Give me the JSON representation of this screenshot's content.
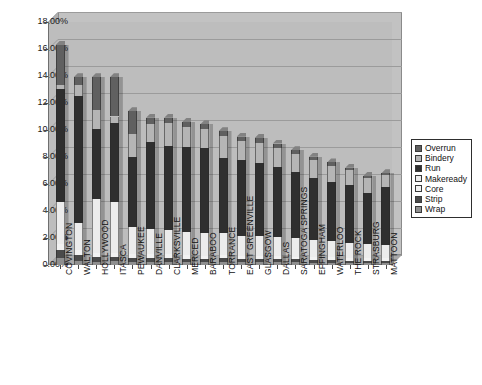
{
  "chart_data": {
    "type": "bar",
    "subtype": "stacked-column-3d",
    "title": "",
    "xlabel": "",
    "ylabel": "",
    "ylim": [
      0,
      0.18
    ],
    "ytick_labels": [
      "18.00%",
      "16.00%",
      "14.00%",
      "12.00%",
      "10.00%",
      "8.00%",
      "6.00%",
      "4.00%",
      "2.00%",
      "0.00%"
    ],
    "ytick_values": [
      18.0,
      16.0,
      14.0,
      12.0,
      10.0,
      8.0,
      6.0,
      4.0,
      2.0,
      0.0
    ],
    "grid": true,
    "legend_position": "right",
    "categories": [
      "COVINGTON",
      "WALTON",
      "HOLLYWOOD",
      "ITASCA",
      "PEWAUKEE",
      "DANVILLE",
      "CLARKSVILLE",
      "MERCED",
      "BARABOO",
      "TORRANCE",
      "EAST GREENVILLE",
      "GLASGOW",
      "DALLAS",
      "SARATOGA SPRINGS",
      "EFFINGHAM",
      "WATERLOO",
      "THE ROCK",
      "STRASBURG",
      "MATTOON"
    ],
    "series": [
      {
        "name": "Wrap",
        "color": "#8f8f8f",
        "values": [
          0.55,
          0.3,
          0.25,
          0.3,
          0.25,
          0.2,
          0.25,
          0.2,
          0.2,
          0.25,
          0.2,
          0.2,
          0.2,
          0.2,
          0.18,
          0.18,
          0.15,
          0.15,
          0.15
        ]
      },
      {
        "name": "Strip",
        "color": "#4a4a4a",
        "values": [
          0.55,
          0.45,
          0.35,
          0.3,
          0.3,
          0.3,
          0.3,
          0.25,
          0.25,
          0.25,
          0.25,
          0.25,
          0.25,
          0.22,
          0.2,
          0.2,
          0.18,
          0.18,
          0.18
        ]
      },
      {
        "name": "Core",
        "color": "#f2f2f2",
        "values": [
          0.45,
          0.35,
          0.3,
          0.3,
          0.28,
          0.28,
          0.26,
          0.26,
          0.24,
          0.24,
          0.22,
          0.22,
          0.22,
          0.2,
          0.2,
          0.18,
          0.18,
          0.16,
          0.16
        ]
      },
      {
        "name": "Makeready",
        "color": "#ececec",
        "values": [
          3.1,
          2.0,
          4.0,
          3.8,
          2.0,
          1.9,
          1.8,
          1.7,
          1.7,
          1.6,
          1.5,
          1.5,
          1.4,
          1.4,
          1.3,
          1.2,
          1.1,
          1.05,
          1.0
        ]
      },
      {
        "name": "Run",
        "color": "#2f2f2f",
        "values": [
          8.4,
          9.4,
          5.2,
          5.8,
          5.2,
          6.4,
          6.2,
          6.3,
          6.3,
          5.6,
          5.6,
          5.4,
          5.2,
          4.9,
          4.6,
          4.4,
          4.3,
          3.8,
          4.3
        ]
      },
      {
        "name": "Bindery",
        "color": "#b5b5b5",
        "values": [
          0.3,
          0.8,
          1.4,
          0.5,
          1.7,
          1.4,
          1.7,
          1.5,
          1.4,
          1.6,
          1.4,
          1.5,
          1.4,
          1.3,
          1.3,
          1.2,
          1.1,
          1.1,
          0.9
        ]
      },
      {
        "name": "Overrun",
        "color": "#606060",
        "values": [
          2.95,
          0.6,
          2.4,
          2.9,
          1.65,
          0.42,
          0.39,
          0.39,
          0.33,
          0.36,
          0.33,
          0.33,
          0.33,
          0.28,
          0.24,
          0.24,
          0.19,
          0.16,
          0.11
        ]
      }
    ],
    "totals": [
      16.3,
      13.9,
      13.9,
      13.9,
      11.36,
      10.9,
      10.9,
      10.6,
      10.42,
      9.9,
      9.5,
      9.4,
      9.0,
      8.5,
      8.02,
      7.6,
      7.2,
      6.6,
      6.8
    ]
  },
  "legend": {
    "items": [
      {
        "label": "Overrun",
        "color": "#606060"
      },
      {
        "label": "Bindery",
        "color": "#b5b5b5"
      },
      {
        "label": "Run",
        "color": "#2f2f2f"
      },
      {
        "label": "Makeready",
        "color": "#ececec"
      },
      {
        "label": "Core",
        "color": "#f2f2f2"
      },
      {
        "label": "Strip",
        "color": "#4a4a4a"
      },
      {
        "label": "Wrap",
        "color": "#8f8f8f"
      }
    ]
  },
  "plot": {
    "background_color": "#bdbdbd",
    "back_wall_color": "#c2c2c2",
    "gridline_color": "#9b9b9b"
  }
}
